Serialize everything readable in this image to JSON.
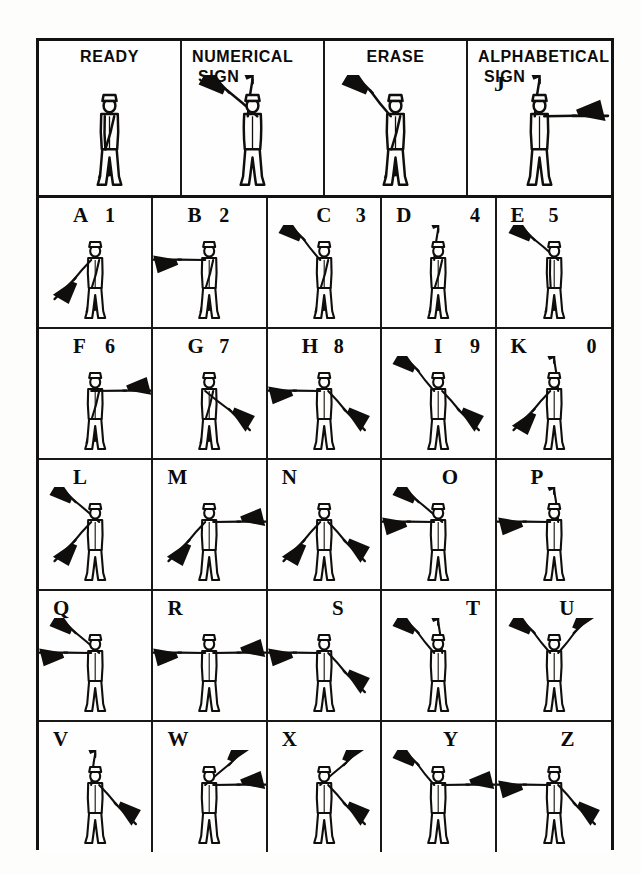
{
  "page": {
    "ink_color": "#100e0c",
    "paper_color": "#fdfdfc"
  },
  "special_row": [
    {
      "id": "ready",
      "title_line1": "READY",
      "title_line2": "",
      "side_letter": "",
      "pose": "ready"
    },
    {
      "id": "numerical-sign",
      "title_line1": "NUMERICAL",
      "title_line2": "SIGN",
      "side_letter": "",
      "pose": "numerical"
    },
    {
      "id": "erase",
      "title_line1": "ERASE",
      "title_line2": "",
      "side_letter": "",
      "pose": "erase"
    },
    {
      "id": "alphabetical-sign",
      "title_line1": "ALPHABETICAL",
      "title_line2": "SIGN",
      "side_letter": "J",
      "pose": "alphabetical"
    }
  ],
  "letter_rows": [
    [
      {
        "letter": "A",
        "number": "1",
        "letter_pos": "pos-midl",
        "number_pos": "pos-midr",
        "pose": "A"
      },
      {
        "letter": "B",
        "number": "2",
        "letter_pos": "pos-midl",
        "number_pos": "pos-midr",
        "pose": "B"
      },
      {
        "letter": "C",
        "number": "3",
        "letter_pos": "pos-center",
        "number_pos": "pos-right",
        "pose": "C"
      },
      {
        "letter": "D",
        "number": "4",
        "letter_pos": "pos-left",
        "number_pos": "pos-right",
        "pose": "D"
      },
      {
        "letter": "E",
        "number": "5",
        "letter_pos": "pos-left",
        "number_pos": "pos-midl2",
        "pose": "E"
      }
    ],
    [
      {
        "letter": "F",
        "number": "6",
        "letter_pos": "pos-midl",
        "number_pos": "pos-midr",
        "pose": "F"
      },
      {
        "letter": "G",
        "number": "7",
        "letter_pos": "pos-midl",
        "number_pos": "pos-midr",
        "pose": "G"
      },
      {
        "letter": "H",
        "number": "8",
        "letter_pos": "pos-midl",
        "number_pos": "pos-midr",
        "pose": "H"
      },
      {
        "letter": "I",
        "number": "9",
        "letter_pos": "pos-center",
        "number_pos": "pos-right",
        "pose": "I"
      },
      {
        "letter": "K",
        "number": "0",
        "letter_pos": "pos-left",
        "number_pos": "pos-right",
        "pose": "K"
      }
    ],
    [
      {
        "letter": "L",
        "number": "",
        "letter_pos": "pos-midl",
        "number_pos": "",
        "pose": "L"
      },
      {
        "letter": "M",
        "number": "",
        "letter_pos": "pos-left",
        "number_pos": "",
        "pose": "M"
      },
      {
        "letter": "N",
        "number": "",
        "letter_pos": "pos-left",
        "number_pos": "",
        "pose": "N"
      },
      {
        "letter": "O",
        "number": "",
        "letter_pos": "pos-midr",
        "number_pos": "",
        "pose": "O"
      },
      {
        "letter": "P",
        "number": "",
        "letter_pos": "pos-midl",
        "number_pos": "",
        "pose": "P"
      }
    ],
    [
      {
        "letter": "Q",
        "number": "",
        "letter_pos": "pos-left",
        "number_pos": "",
        "pose": "Q"
      },
      {
        "letter": "R",
        "number": "",
        "letter_pos": "pos-left",
        "number_pos": "",
        "pose": "R"
      },
      {
        "letter": "S",
        "number": "",
        "letter_pos": "pos-midr",
        "number_pos": "",
        "pose": "S"
      },
      {
        "letter": "T",
        "number": "",
        "letter_pos": "pos-right",
        "number_pos": "",
        "pose": "T"
      },
      {
        "letter": "U",
        "number": "",
        "letter_pos": "pos-midr",
        "number_pos": "",
        "pose": "U"
      }
    ],
    [
      {
        "letter": "V",
        "number": "",
        "letter_pos": "pos-left",
        "number_pos": "",
        "pose": "V"
      },
      {
        "letter": "W",
        "number": "",
        "letter_pos": "pos-left",
        "number_pos": "",
        "pose": "W"
      },
      {
        "letter": "X",
        "number": "",
        "letter_pos": "pos-left",
        "number_pos": "",
        "pose": "X"
      },
      {
        "letter": "Y",
        "number": "",
        "letter_pos": "pos-midr",
        "number_pos": "",
        "pose": "Y"
      },
      {
        "letter": "Z",
        "number": "",
        "letter_pos": "pos-midr",
        "number_pos": "",
        "pose": "Z"
      }
    ]
  ],
  "poses": {
    "ready": {
      "left_arm": "down-cross",
      "right_arm": "down-cross",
      "left_flag": false,
      "right_flag": true,
      "note": "both flags crossed down in front"
    },
    "numerical": {
      "left_arm": "up-vertical",
      "right_arm": "up-45",
      "left_flag": true,
      "right_flag": true,
      "note": "one flag straight up, other upper-right"
    },
    "erase": {
      "left_arm": "up-45",
      "right_arm": "down-cross",
      "left_flag": true,
      "right_flag": true,
      "note": "left flag up, right flag down"
    },
    "alphabetical": {
      "left_arm": "up-vertical",
      "right_arm": "horizontal",
      "left_flag": true,
      "right_flag": true,
      "note": "flag up and flag out to the side"
    },
    "A": {
      "left_arm": "low-45",
      "right_arm": "down-cross",
      "left_flag": true,
      "right_flag": true
    },
    "B": {
      "left_arm": "horizontal",
      "right_arm": "down-cross",
      "left_flag": true,
      "right_flag": true
    },
    "C": {
      "left_arm": "up-45",
      "right_arm": "down-cross",
      "left_flag": true,
      "right_flag": true
    },
    "D": {
      "left_arm": "up-vertical",
      "right_arm": "down-cross",
      "left_flag": true,
      "right_flag": true
    },
    "E": {
      "left_arm": "down-cross",
      "right_arm": "up-45",
      "left_flag": true,
      "right_flag": true
    },
    "F": {
      "left_arm": "horizontal-r",
      "right_arm": "down-cross",
      "left_flag": true,
      "right_flag": true
    },
    "G": {
      "left_arm": "low-45-r",
      "right_arm": "down-cross",
      "left_flag": true,
      "right_flag": true
    },
    "H": {
      "left_arm": "horizontal",
      "right_arm": "low-45",
      "left_flag": true,
      "right_flag": true
    },
    "I": {
      "left_arm": "up-45",
      "right_arm": "low-45",
      "left_flag": true,
      "right_flag": true
    },
    "K": {
      "left_arm": "low-45",
      "right_arm": "up-vertical",
      "left_flag": true,
      "right_flag": true
    },
    "L": {
      "left_arm": "low-45",
      "right_arm": "up-45",
      "left_flag": true,
      "right_flag": true
    },
    "M": {
      "left_arm": "low-45",
      "right_arm": "horizontal",
      "left_flag": true,
      "right_flag": true
    },
    "N": {
      "left_arm": "low-45",
      "right_arm": "low-45-r",
      "left_flag": true,
      "right_flag": true
    },
    "O": {
      "left_arm": "horizontal",
      "right_arm": "up-45",
      "left_flag": true,
      "right_flag": true
    },
    "P": {
      "left_arm": "horizontal",
      "right_arm": "up-vertical",
      "left_flag": true,
      "right_flag": true
    },
    "Q": {
      "left_arm": "horizontal",
      "right_arm": "up-45",
      "left_flag": true,
      "right_flag": true
    },
    "R": {
      "left_arm": "horizontal",
      "right_arm": "horizontal",
      "left_flag": true,
      "right_flag": true
    },
    "S": {
      "left_arm": "horizontal",
      "right_arm": "low-45-r",
      "left_flag": true,
      "right_flag": true
    },
    "T": {
      "left_arm": "up-45",
      "right_arm": "up-vertical",
      "left_flag": true,
      "right_flag": true
    },
    "U": {
      "left_arm": "up-45",
      "right_arm": "up-45-r",
      "left_flag": true,
      "right_flag": true
    },
    "V": {
      "left_arm": "up-vertical",
      "right_arm": "low-45-r",
      "left_flag": true,
      "right_flag": true
    },
    "W": {
      "left_arm": "up-45-r",
      "right_arm": "horizontal",
      "left_flag": true,
      "right_flag": true
    },
    "X": {
      "left_arm": "up-45-r",
      "right_arm": "low-45-r",
      "left_flag": true,
      "right_flag": true
    },
    "Y": {
      "left_arm": "up-45",
      "right_arm": "horizontal",
      "left_flag": true,
      "right_flag": true
    },
    "Z": {
      "left_arm": "horizontal",
      "right_arm": "low-45-r",
      "left_flag": true,
      "right_flag": true
    }
  }
}
